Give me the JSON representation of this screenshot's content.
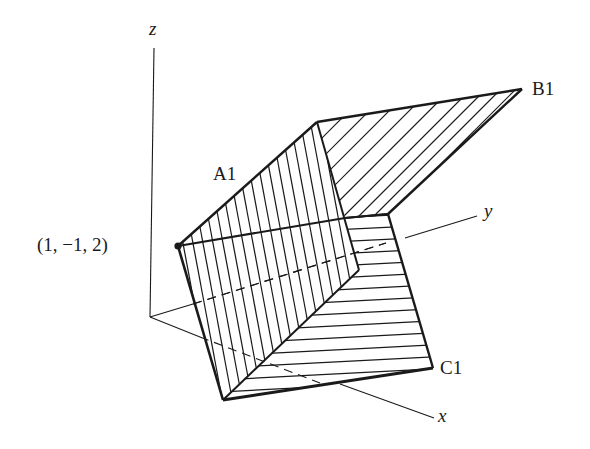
{
  "figure": {
    "axes": {
      "x_label": "x",
      "y_label": "y",
      "z_label": "z"
    },
    "labels": {
      "point": "(1, −1, 2)",
      "plane_a": "A1",
      "plane_b": "B1",
      "plane_c": "C1"
    },
    "colors": {
      "ink": "#1a1a1a",
      "background": "#ffffff"
    }
  }
}
